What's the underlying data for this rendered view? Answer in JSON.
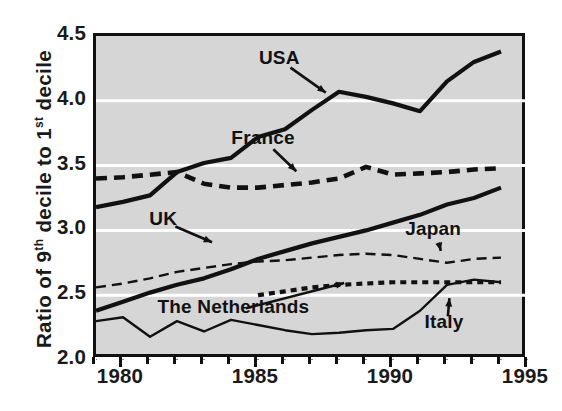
{
  "chart_data": {
    "type": "line",
    "title": "",
    "xlabel": "",
    "ylabel": "Ratio of 9th decile to 1st decile",
    "ylabel_parts": {
      "prefix": "Ratio of 9",
      "sup1": "th",
      "mid": " decile to 1",
      "sup2": "st",
      "suffix": " decile"
    },
    "xlim": [
      1979,
      1995
    ],
    "ylim": [
      2.0,
      4.5
    ],
    "yticks": [
      2.0,
      2.5,
      3.0,
      3.5,
      4.0,
      4.5
    ],
    "ytick_labels": [
      "2.0",
      "2.5",
      "3.0",
      "3.5",
      "4.0",
      "4.5"
    ],
    "xticks": [
      1980,
      1985,
      1990,
      1995
    ],
    "xtick_labels": [
      "1980",
      "1985",
      "1990",
      "1995"
    ],
    "xtick_minor_step": 1,
    "grid": "horizontal-white",
    "grid_color": "#ffffff",
    "grid_values": [
      2.5,
      3.0,
      3.5,
      4.0
    ],
    "plot_background": "#d6d6d6",
    "frame_color": "#111111",
    "legend": "inline-annotations",
    "series": [
      {
        "name": "USA",
        "style": "solid-thick",
        "color": "#111111",
        "x": [
          1979,
          1980,
          1981,
          1982,
          1983,
          1984,
          1985,
          1986,
          1987,
          1988,
          1989,
          1990,
          1991,
          1992,
          1993,
          1994
        ],
        "values": [
          3.18,
          3.22,
          3.27,
          3.45,
          3.52,
          3.56,
          3.72,
          3.78,
          3.93,
          4.07,
          4.03,
          3.98,
          3.92,
          4.15,
          4.3,
          4.38
        ]
      },
      {
        "name": "France",
        "style": "dashed-thick",
        "color": "#111111",
        "x": [
          1979,
          1980,
          1981,
          1982,
          1983,
          1984,
          1985,
          1986,
          1987,
          1988,
          1989,
          1990,
          1991,
          1992,
          1993,
          1994
        ],
        "values": [
          3.4,
          3.41,
          3.43,
          3.45,
          3.36,
          3.33,
          3.33,
          3.35,
          3.37,
          3.4,
          3.49,
          3.43,
          3.44,
          3.45,
          3.47,
          3.48
        ]
      },
      {
        "name": "UK",
        "style": "solid-thick",
        "color": "#111111",
        "x": [
          1979,
          1980,
          1981,
          1982,
          1983,
          1984,
          1985,
          1986,
          1987,
          1988,
          1989,
          1990,
          1991,
          1992,
          1993,
          1994
        ],
        "values": [
          2.38,
          2.45,
          2.52,
          2.58,
          2.63,
          2.7,
          2.78,
          2.84,
          2.9,
          2.95,
          3.0,
          3.06,
          3.12,
          3.2,
          3.25,
          3.33
        ]
      },
      {
        "name": "Japan",
        "style": "dashed-thin",
        "color": "#111111",
        "x": [
          1979,
          1980,
          1981,
          1982,
          1983,
          1984,
          1985,
          1986,
          1987,
          1988,
          1989,
          1990,
          1991,
          1992,
          1993,
          1994
        ],
        "values": [
          2.56,
          2.59,
          2.63,
          2.68,
          2.71,
          2.74,
          2.76,
          2.77,
          2.79,
          2.81,
          2.82,
          2.81,
          2.78,
          2.75,
          2.78,
          2.79
        ]
      },
      {
        "name": "The Netherlands",
        "style": "dotted-thick",
        "color": "#111111",
        "x": [
          1985,
          1986,
          1987,
          1988,
          1989,
          1990,
          1991,
          1992,
          1993,
          1994
        ],
        "values": [
          2.5,
          2.53,
          2.56,
          2.58,
          2.59,
          2.6,
          2.6,
          2.6,
          2.6,
          2.6
        ]
      },
      {
        "name": "Italy",
        "style": "solid-thin",
        "color": "#111111",
        "x": [
          1979,
          1980,
          1981,
          1982,
          1983,
          1984,
          1985,
          1986,
          1987,
          1988,
          1989,
          1990,
          1991,
          1992,
          1993,
          1994
        ],
        "values": [
          2.3,
          2.33,
          2.18,
          2.3,
          2.22,
          2.31,
          2.27,
          2.23,
          2.2,
          2.21,
          2.23,
          2.24,
          2.38,
          2.58,
          2.62,
          2.6
        ]
      }
    ],
    "annotations": [
      {
        "label": "USA",
        "x": 1985.9,
        "y": 4.3,
        "arrow_to": {
          "x": 1987.6,
          "y": 4.05
        }
      },
      {
        "label": "France",
        "x": 1985.3,
        "y": 3.68,
        "arrow_to": {
          "x": 1986.5,
          "y": 3.44
        }
      },
      {
        "label": "UK",
        "x": 1981.6,
        "y": 3.06,
        "arrow_to": {
          "x": 1983.4,
          "y": 2.9
        }
      },
      {
        "label": "Japan",
        "x": 1991.6,
        "y": 2.98,
        "arrow_to": {
          "x": 1991.8,
          "y": 2.82
        }
      },
      {
        "label": "The Netherlands",
        "x": 1984.2,
        "y": 2.38,
        "arrow_to": {
          "x": 1988.3,
          "y": 2.6
        }
      },
      {
        "label": "Italy",
        "x": 1992.0,
        "y": 2.26,
        "arrow_to": {
          "x": 1992.1,
          "y": 2.5
        }
      }
    ]
  }
}
